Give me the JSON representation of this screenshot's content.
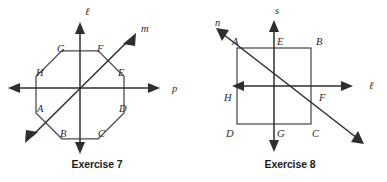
{
  "page": {
    "background_color": "#ffffff",
    "width": 387,
    "height": 182
  },
  "figures": [
    {
      "id": "exercise-7",
      "caption": "Exercise 7",
      "shape": "regular-octagon",
      "shape_color": "#4a4a4a",
      "line_color": "#2e2e2e",
      "center": {
        "x": 80,
        "y": 88
      },
      "lines": [
        {
          "name": "l",
          "label": "ℓ",
          "orientation": "vertical",
          "label_x": 85,
          "label_y": 15
        },
        {
          "name": "m",
          "label": "m",
          "orientation": "diagonal-up-right",
          "label_x": 141,
          "label_y": 32
        },
        {
          "name": "p",
          "label": "p",
          "orientation": "horizontal",
          "label_x": 172,
          "label_y": 92
        }
      ],
      "vertex_labels": [
        {
          "label": "G",
          "x": 57,
          "y": 52
        },
        {
          "label": "F",
          "x": 97,
          "y": 52
        },
        {
          "label": "H",
          "x": 36,
          "y": 76
        },
        {
          "label": "E",
          "x": 118,
          "y": 76
        },
        {
          "label": "A",
          "x": 37,
          "y": 112
        },
        {
          "label": "D",
          "x": 119,
          "y": 112
        },
        {
          "label": "B",
          "x": 60,
          "y": 137
        },
        {
          "label": "C",
          "x": 98,
          "y": 137
        }
      ]
    },
    {
      "id": "exercise-8",
      "caption": "Exercise 8",
      "shape": "square",
      "shape_color": "#4a4a4a",
      "line_color": "#2e2e2e",
      "center": {
        "x": 80,
        "y": 86
      },
      "lines": [
        {
          "name": "s",
          "label": "s",
          "orientation": "vertical",
          "label_x": 82,
          "label_y": 14
        },
        {
          "name": "n",
          "label": "n",
          "orientation": "diagonal-up-left",
          "label_x": 22,
          "label_y": 26
        },
        {
          "name": "l",
          "label": "ℓ",
          "orientation": "horizontal",
          "label_x": 176,
          "label_y": 89
        }
      ],
      "vertex_labels": [
        {
          "label": "A",
          "x": 39,
          "y": 45
        },
        {
          "label": "E",
          "x": 84,
          "y": 45
        },
        {
          "label": "B",
          "x": 123,
          "y": 45
        },
        {
          "label": "H",
          "x": 31,
          "y": 101
        },
        {
          "label": "F",
          "x": 126,
          "y": 101
        },
        {
          "label": "D",
          "x": 33,
          "y": 137
        },
        {
          "label": "G",
          "x": 84,
          "y": 137
        },
        {
          "label": "C",
          "x": 119,
          "y": 137
        }
      ]
    }
  ]
}
